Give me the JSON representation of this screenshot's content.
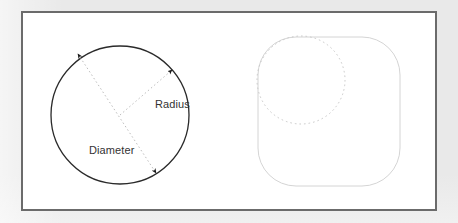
{
  "figure": {
    "background_color": "#e9e9e9",
    "panel_color": "#ffffff",
    "frame_color": "#6b6b6b",
    "labels": {
      "radius": "Radius",
      "diameter": "Diameter"
    },
    "left_shape": {
      "name": "circle",
      "stroke_color": "#2a2a2a",
      "center": {
        "x": 120,
        "y": 115
      },
      "radius": 69
    },
    "right_shape": {
      "name": "rounded-square",
      "stroke_color": "#cfcfcf",
      "x": 258,
      "y": 37,
      "width": 142,
      "height": 149,
      "corner_radius": 38
    },
    "right_inner_shape": {
      "name": "dashed-circle",
      "stroke_color": "#c9c9c9",
      "center": {
        "x": 301,
        "y": 80
      },
      "radius": 44,
      "dash": "1.6 3"
    },
    "leader_lines": {
      "color": "#bdbdbd",
      "dash": "1.5 2.6",
      "arrow_color": "#1a1a1a",
      "radius_line": {
        "from": {
          "x": 120,
          "y": 115
        },
        "to": {
          "x": 172,
          "y": 70
        }
      },
      "diameter_line": {
        "from": {
          "x": 78,
          "y": 54
        },
        "to": {
          "x": 156,
          "y": 173
        }
      }
    }
  }
}
